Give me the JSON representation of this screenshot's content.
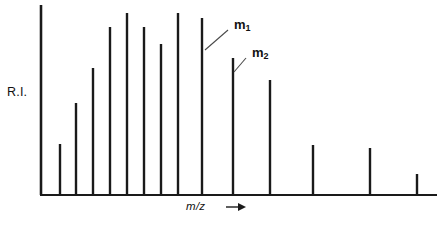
{
  "figure": {
    "width": 446,
    "height": 225,
    "background": "#ffffff",
    "ink_color": "#1a1a1a",
    "leader_color": "#4a4a4a"
  },
  "axes": {
    "y_axis_label": "R.I.",
    "x_axis_label": "m/z",
    "x_axis_arrow": "right-arrow",
    "origin_x": 41,
    "baseline_y": 195,
    "y_axis_top": 5,
    "x_axis_right": 437
  },
  "annotations": [
    {
      "id": "m1",
      "text": "m",
      "subscript": "1",
      "label_x": 234,
      "label_y": 18,
      "leader_from_x": 228,
      "leader_from_y": 30,
      "leader_to_x": 205,
      "leader_to_y": 50,
      "points_to_peak_index": 9
    },
    {
      "id": "m2",
      "text": "m",
      "subscript": "2",
      "label_x": 252,
      "label_y": 46,
      "leader_from_x": 246,
      "leader_from_y": 58,
      "leader_to_x": 234,
      "leader_to_y": 72,
      "points_to_peak_index": 10
    }
  ],
  "chart_data": {
    "type": "bar",
    "title": "",
    "xlabel": "m/z",
    "ylabel": "R.I.",
    "grid": false,
    "legend": false,
    "axis_ticks_labeled": false,
    "note": "Mass spectrum stick plot; relative intensity (R.I.) versus m/z. Values are relative intensities estimated from bar heights as a percentage of the tallest peak.",
    "categories": [
      "p1",
      "p2",
      "p3",
      "p4",
      "p5",
      "p6",
      "p7",
      "p8",
      "p9",
      "m1",
      "m2",
      "p12",
      "p13",
      "p14",
      "p15"
    ],
    "x_positions": [
      41,
      60,
      76,
      93,
      110,
      127,
      144,
      161,
      178,
      202,
      233,
      270,
      313,
      370,
      417
    ],
    "top_y": [
      5,
      144,
      103,
      68,
      27,
      13,
      27,
      44,
      13,
      18,
      58,
      80,
      145,
      148,
      174
    ],
    "values": [
      100,
      27,
      48,
      67,
      88,
      96,
      88,
      79,
      96,
      93,
      72,
      61,
      26,
      25,
      11
    ],
    "ylim": [
      0,
      100
    ],
    "labeled_points": [
      {
        "category": "m1",
        "label": "m1"
      },
      {
        "category": "m2",
        "label": "m2"
      }
    ]
  }
}
